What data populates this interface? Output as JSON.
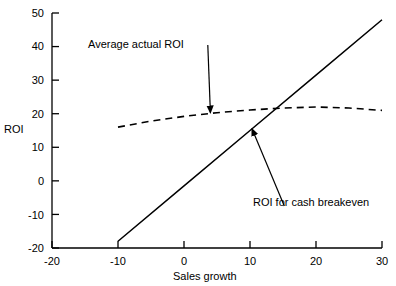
{
  "chart_data": {
    "type": "line",
    "title": "",
    "xlabel": "Sales growth",
    "ylabel": "ROI",
    "xlim": [
      -20,
      30
    ],
    "ylim": [
      -20,
      50
    ],
    "xticks": [
      -20,
      -10,
      0,
      10,
      20,
      30
    ],
    "xtick_labels": [
      "-20",
      "-10",
      "0",
      "10",
      "20",
      "30"
    ],
    "yticks": [
      -20,
      -10,
      0,
      10,
      20,
      30,
      40,
      50
    ],
    "ytick_labels": [
      "-20",
      "-10",
      "0",
      "10",
      "20",
      "30",
      "40",
      "50"
    ],
    "grid": false,
    "legend": "none",
    "series": [
      {
        "name": "ROI for cash breakeven",
        "style": "solid",
        "color": "#000000",
        "x": [
          -10,
          0,
          10,
          20,
          30
        ],
        "y": [
          -18,
          -1.5,
          15,
          31.5,
          48
        ]
      },
      {
        "name": "Average actual ROI",
        "style": "dashed",
        "color": "#000000",
        "x": [
          -10,
          -5,
          0,
          5,
          10,
          15,
          20,
          25,
          30
        ],
        "y": [
          16,
          17.8,
          19.2,
          20.3,
          21.1,
          21.7,
          22,
          21.7,
          21
        ]
      }
    ],
    "annotations": [
      {
        "text": "Average actual ROI",
        "label_x": 3.6,
        "label_y": 40.5,
        "points_to_x": 4,
        "points_to_y": 20.3
      },
      {
        "text": "ROI for cash breakeven",
        "label_x": 15.2,
        "label_y": -7.5,
        "points_to_x": 10.3,
        "points_to_y": 15.5
      }
    ],
    "intersection": {
      "x": 10.3,
      "y": 15.5
    }
  }
}
